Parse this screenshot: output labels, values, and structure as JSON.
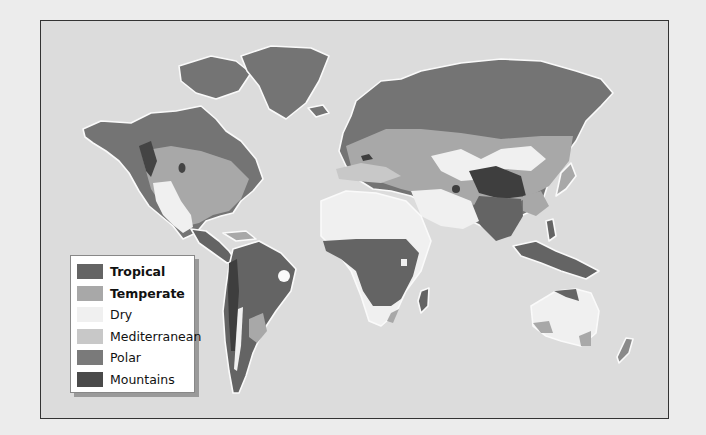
{
  "map": {
    "type": "world climate zones map",
    "colors": {
      "ocean": "#dcdcdc",
      "tropical": "#646464",
      "temperate": "#a8a8a8",
      "dry": "#f0f0f0",
      "mediterranean": "#c4c4c4",
      "polar": "#7a7a7a",
      "mountains": "#3e3e3e",
      "coast": "#fafafa"
    }
  },
  "legend": {
    "items": [
      {
        "label": "Tropical",
        "color": "#646464",
        "bold": true
      },
      {
        "label": "Temperate",
        "color": "#a8a8a8",
        "bold": true
      },
      {
        "label": "Dry",
        "color": "#f0f0f0",
        "bold": false
      },
      {
        "label": "Mediterranean",
        "color": "#c8c8c8",
        "bold": false
      },
      {
        "label": "Polar",
        "color": "#7a7a7a",
        "bold": false
      },
      {
        "label": "Mountains",
        "color": "#4a4a4a",
        "bold": false
      }
    ]
  }
}
